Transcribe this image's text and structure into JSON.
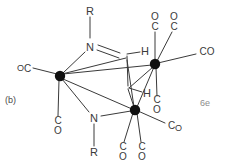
{
  "figure": {
    "panel_label": "(b)",
    "electron_label": "6e",
    "ink_color": "#3a3a3a",
    "background_color": "#ffffff",
    "width": 227,
    "height": 166
  },
  "atoms": {
    "metal_left": {
      "symbol": "",
      "x": 60,
      "y": 76
    },
    "metal_right": {
      "symbol": "",
      "x": 155,
      "y": 64
    },
    "metal_bottom": {
      "symbol": "",
      "x": 135,
      "y": 110
    },
    "nitrogen_top": {
      "symbol": "N",
      "x": 90,
      "y": 47
    },
    "nitrogen_bottom": {
      "symbol": "N",
      "x": 94,
      "y": 117
    },
    "carbon_top": {
      "symbol": "",
      "x": 126,
      "y": 56
    },
    "carbon_bottom": {
      "symbol": "",
      "x": 127,
      "y": 88
    }
  },
  "labels": {
    "r_top": "R",
    "r_bottom": "R",
    "n_top": "N",
    "n_bottom": "N",
    "h_top": "H",
    "h_bottom": "H",
    "co_left": {
      "first": "O",
      "second": "C"
    },
    "co_left_bottom": {
      "first": "C",
      "second": "O"
    },
    "co_right_top_a": {
      "first": "O",
      "second": "C"
    },
    "co_right_top_b": {
      "first": "O",
      "second": "C"
    },
    "co_right_side": {
      "first": "C",
      "second": "O"
    },
    "co_right_lower": {
      "first": "C",
      "second": "O"
    },
    "co_bottom_right": {
      "first": "C",
      "second": "O"
    },
    "co_bottom_a": {
      "first": "C",
      "second": "O"
    },
    "co_bottom_b": {
      "first": "C",
      "second": "O"
    }
  },
  "ligand_positions": {
    "co_left": {
      "x": 24,
      "y": 68
    },
    "co_left_bottom": {
      "x": 58,
      "y": 126
    },
    "co_right_top_a": {
      "x": 155,
      "y": 22
    },
    "co_right_top_b": {
      "x": 174,
      "y": 22
    },
    "co_right_side": {
      "x": 207,
      "y": 52
    },
    "co_right_lower": {
      "x": 157,
      "y": 105
    },
    "co_bottom_right": {
      "x": 175,
      "y": 127
    },
    "co_bottom_a": {
      "x": 123,
      "y": 152
    },
    "co_bottom_b": {
      "x": 142,
      "y": 152
    }
  }
}
